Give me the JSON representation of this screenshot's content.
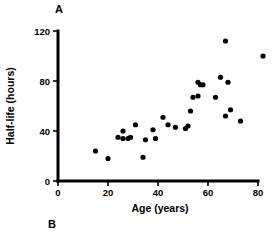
{
  "figure": {
    "panel_a_label": "A",
    "panel_b_label": "B"
  },
  "chart_data": {
    "type": "scatter",
    "title": "",
    "xlabel": "Age (years)",
    "ylabel": "Half-life (hours)",
    "xlim": [
      0,
      80
    ],
    "ylim": [
      0,
      120
    ],
    "xticks": [
      0,
      20,
      40,
      60,
      80
    ],
    "yticks": [
      0,
      40,
      80,
      120
    ],
    "xtick_labels": [
      "0",
      "20",
      "40",
      "60",
      "80"
    ],
    "ytick_labels": [
      "0",
      "40",
      "80",
      "120"
    ],
    "grid": false,
    "legend": false,
    "marker": "filled-circle",
    "marker_color": "#000000",
    "points": [
      {
        "x": 15,
        "y": 24
      },
      {
        "x": 20,
        "y": 18
      },
      {
        "x": 24,
        "y": 35
      },
      {
        "x": 26,
        "y": 40
      },
      {
        "x": 26,
        "y": 34
      },
      {
        "x": 28,
        "y": 34
      },
      {
        "x": 29,
        "y": 35
      },
      {
        "x": 31,
        "y": 45
      },
      {
        "x": 34,
        "y": 19
      },
      {
        "x": 35,
        "y": 33
      },
      {
        "x": 38,
        "y": 41
      },
      {
        "x": 39,
        "y": 34
      },
      {
        "x": 42,
        "y": 51
      },
      {
        "x": 44,
        "y": 45
      },
      {
        "x": 47,
        "y": 43
      },
      {
        "x": 51,
        "y": 42
      },
      {
        "x": 52,
        "y": 44
      },
      {
        "x": 53,
        "y": 56
      },
      {
        "x": 54,
        "y": 67
      },
      {
        "x": 56,
        "y": 79
      },
      {
        "x": 56,
        "y": 68
      },
      {
        "x": 57,
        "y": 77
      },
      {
        "x": 58,
        "y": 77
      },
      {
        "x": 63,
        "y": 67
      },
      {
        "x": 65,
        "y": 83
      },
      {
        "x": 67,
        "y": 112
      },
      {
        "x": 67,
        "y": 52
      },
      {
        "x": 68,
        "y": 79
      },
      {
        "x": 69,
        "y": 57
      },
      {
        "x": 73,
        "y": 48
      },
      {
        "x": 82,
        "y": 100
      }
    ]
  }
}
